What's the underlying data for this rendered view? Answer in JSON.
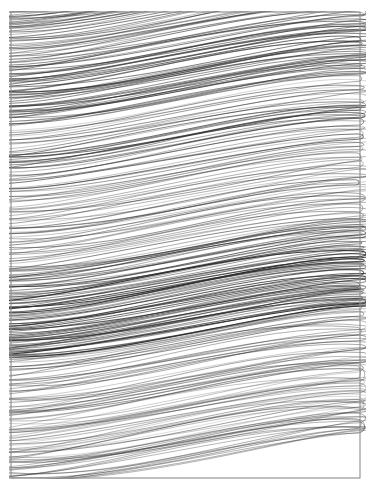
{
  "canvas": {
    "width": 374,
    "height": 492,
    "background_color": "#ffffff",
    "title": "abstract-scribble-drawing"
  },
  "frame": {
    "name": "border-rectangle",
    "x": 11,
    "y": 12,
    "width": 349,
    "height": 466,
    "stroke_color": "#8c8c8c",
    "stroke_width": 1.1,
    "fill": "none"
  },
  "artwork": {
    "type": "continuous-line-scribble",
    "description": "Dense continuous back-and-forth looping pen scribble filling a rectangular frame",
    "ink_color": "#2a2a2a",
    "medium": "pen-on-paper",
    "stroke_orientation": "near-horizontal",
    "slope_degrees": -8,
    "turnaround_edge": "right",
    "loop_count": 330
  },
  "chart_data": {
    "type": "line",
    "xlabel": "",
    "ylabel": "",
    "xlim": [
      11,
      360
    ],
    "ylim": [
      12,
      478
    ],
    "grid": false,
    "legend": "none",
    "stroke_color": "#2a2a2a",
    "bands": [
      {
        "name": "top-dense",
        "y_start": 12,
        "y_end": 120,
        "density": 0.88,
        "opacity": 0.72,
        "amplitude": 9,
        "width": 1.0
      },
      {
        "name": "upper-medium",
        "y_start": 120,
        "y_end": 200,
        "density": 0.74,
        "opacity": 0.62,
        "amplitude": 11,
        "width": 1.0
      },
      {
        "name": "mid-light",
        "y_start": 200,
        "y_end": 255,
        "density": 0.62,
        "opacity": 0.55,
        "amplitude": 12,
        "width": 0.95
      },
      {
        "name": "mid-medium",
        "y_start": 255,
        "y_end": 300,
        "density": 0.78,
        "opacity": 0.66,
        "amplitude": 10,
        "width": 1.0
      },
      {
        "name": "dark-core",
        "y_start": 300,
        "y_end": 355,
        "density": 1.0,
        "opacity": 0.85,
        "amplitude": 8,
        "width": 1.05
      },
      {
        "name": "lower-medium",
        "y_start": 355,
        "y_end": 410,
        "density": 0.66,
        "opacity": 0.58,
        "amplitude": 13,
        "width": 0.95
      },
      {
        "name": "bottom-sparse",
        "y_start": 410,
        "y_end": 478,
        "density": 0.4,
        "opacity": 0.52,
        "amplitude": 18,
        "width": 0.9
      }
    ],
    "series": [
      {
        "name": "scribble-strokes",
        "values": [
          0.88,
          0.74,
          0.62,
          0.78,
          1.0,
          0.66,
          0.4
        ]
      }
    ],
    "categories": [
      "top-dense",
      "upper-medium",
      "mid-light",
      "mid-medium",
      "dark-core",
      "lower-medium",
      "bottom-sparse"
    ]
  }
}
